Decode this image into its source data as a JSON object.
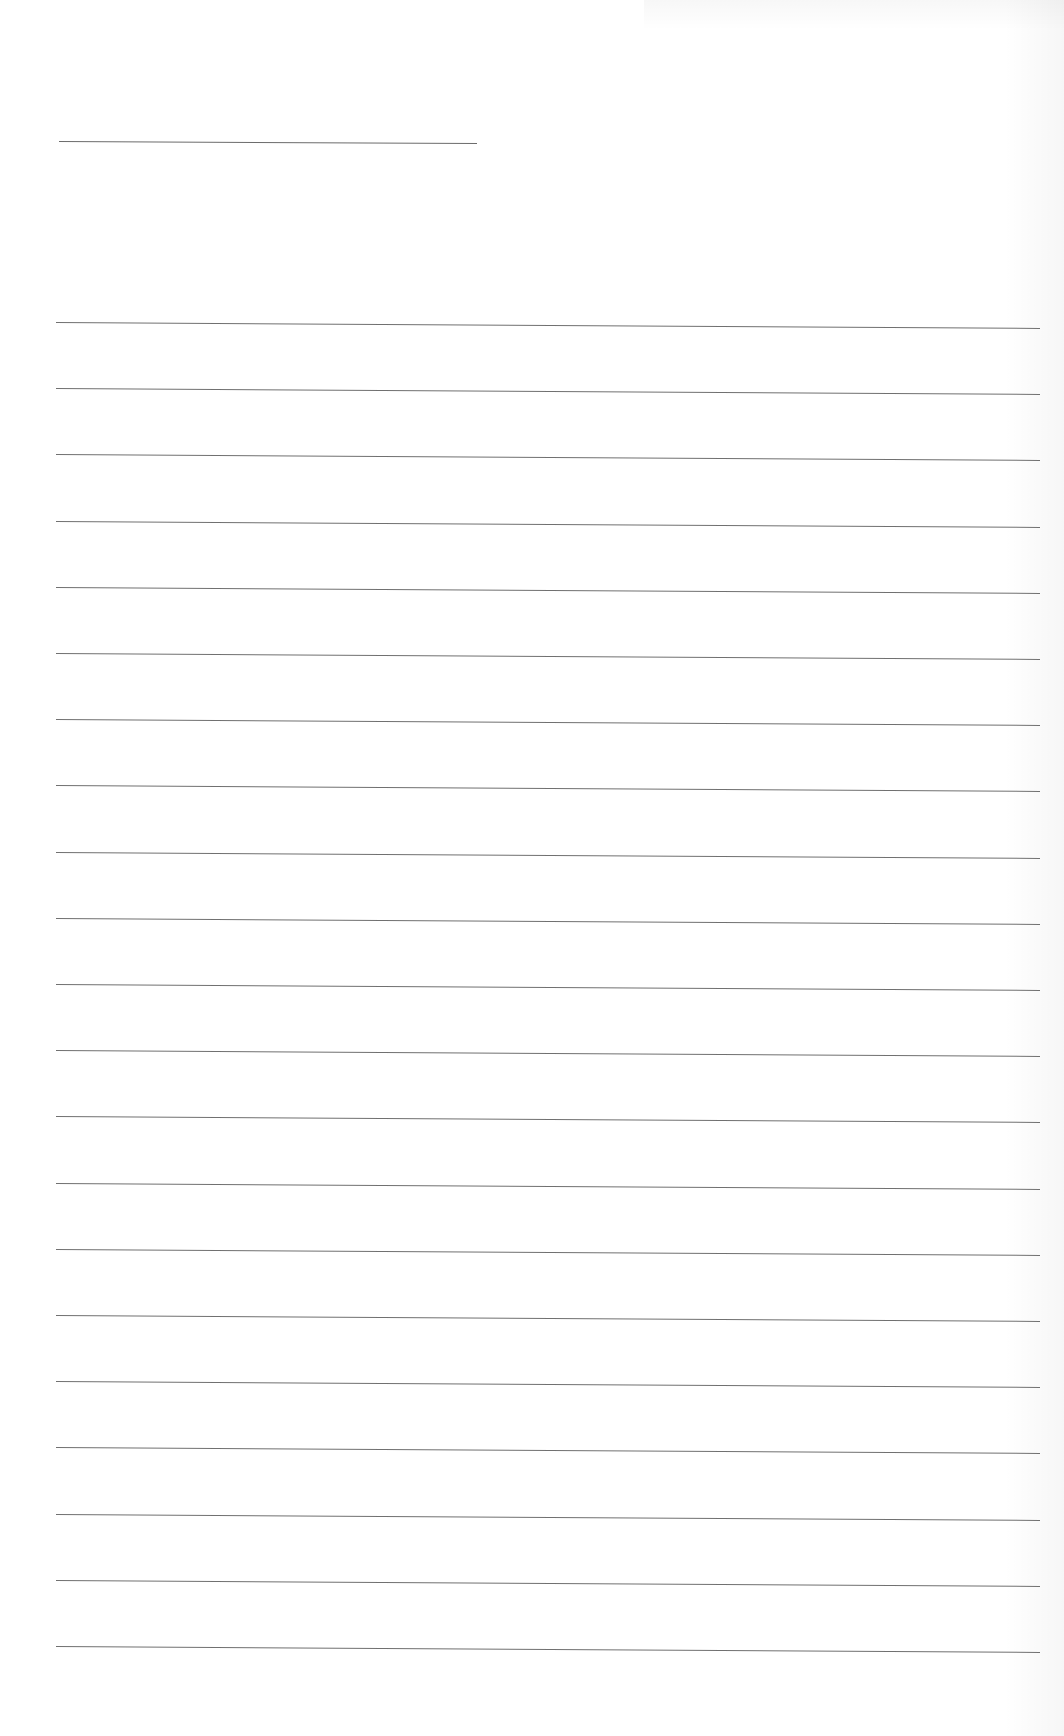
{
  "document": {
    "type": "blank lined sheet",
    "header_line": {
      "x1": 59,
      "x2": 477,
      "y": 141,
      "drop": 2
    },
    "rules": {
      "count": 21,
      "first_y": 322,
      "spacing": 66.2,
      "x1": 56,
      "x2": 1040,
      "drop": 6
    },
    "colors": {
      "paper": "#ffffff",
      "line": "#707070"
    }
  }
}
